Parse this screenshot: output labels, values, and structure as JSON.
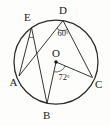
{
  "figure": {
    "background_color": "#fdfdfb",
    "stroke_color": "#2a2a2a",
    "circle": {
      "center_label": "O",
      "center_x": 56,
      "center_y": 62,
      "radius": 42
    },
    "points": [
      {
        "label": "A",
        "x": 19.0,
        "y": 76.0,
        "label_x": 9.5,
        "label_y": 86.0
      },
      {
        "label": "B",
        "x": 47.0,
        "y": 103.5,
        "label_x": 43.0,
        "label_y": 119.0
      },
      {
        "label": "C",
        "x": 92.5,
        "y": 77.5,
        "label_x": 95.0,
        "label_y": 88.0
      },
      {
        "label": "D",
        "x": 63.0,
        "y": 20.5,
        "label_x": 59.0,
        "label_y": 14.0
      },
      {
        "label": "E",
        "x": 31.5,
        "y": 27.5,
        "label_x": 24.0,
        "label_y": 21.0
      },
      {
        "label": "O",
        "x": 56.0,
        "y": 62.0,
        "label_x": 52.0,
        "label_y": 57.0
      }
    ],
    "chords": [
      {
        "name": "chord-E-A",
        "from": "E",
        "to": "A"
      },
      {
        "name": "chord-E-B",
        "from": "E",
        "to": "B"
      },
      {
        "name": "chord-D-A",
        "from": "D",
        "to": "A"
      },
      {
        "name": "chord-D-C",
        "from": "D",
        "to": "C"
      }
    ],
    "radii": [
      {
        "name": "radius-O-B",
        "from": "O",
        "to": "B"
      },
      {
        "name": "radius-O-C",
        "from": "O",
        "to": "C"
      }
    ],
    "angles": [
      {
        "name": "angle-at-D",
        "vertex": "D",
        "value": "60",
        "degree_symbol": "°",
        "label_x": 57.5,
        "label_y": 36.0,
        "type": "inscribed"
      },
      {
        "name": "angle-at-O",
        "vertex": "O",
        "value": "72",
        "degree_symbol": "°",
        "label_x": 58.5,
        "label_y": 80.0,
        "type": "central"
      },
      {
        "name": "angle-at-E",
        "vertex": "E",
        "value": "",
        "degree_symbol": "",
        "label_x": 0,
        "label_y": 0,
        "type": "inscribed-unlabeled"
      }
    ]
  }
}
